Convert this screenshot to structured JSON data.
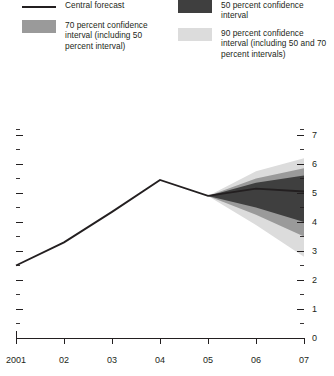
{
  "legend": {
    "entries": [
      {
        "name": "central-forecast",
        "type": "line",
        "color": "#231f20",
        "label": "Central forecast"
      },
      {
        "name": "ci-50",
        "type": "swatch",
        "color": "#3f3f3f",
        "label": "50 percent confidence interval"
      },
      {
        "name": "ci-70",
        "type": "swatch",
        "color": "#9a9a9a",
        "label": "70 percent confidence interval (including 50 percent interval)"
      },
      {
        "name": "ci-90",
        "type": "swatch",
        "color": "#dcdcdc",
        "label": "90 percent confidence interval (including 50 and 70 percent intervals)"
      }
    ]
  },
  "chart_data": {
    "type": "area",
    "title": "",
    "xlabel": "",
    "ylabel": "",
    "xlim": [
      2001,
      2007
    ],
    "ylim": [
      0,
      7.3
    ],
    "grid": false,
    "legend_position": "top",
    "x_tick_labels": [
      "2001",
      "02",
      "03",
      "04",
      "05",
      "06",
      "07"
    ],
    "x_ticks": [
      2001,
      2002,
      2003,
      2004,
      2005,
      2006,
      2007
    ],
    "y_tick_labels": [
      "0",
      "1",
      "2",
      "3",
      "4",
      "5",
      "6",
      "7"
    ],
    "y_ticks": [
      0,
      1,
      2,
      3,
      4,
      5,
      6,
      7
    ],
    "y_minor_ticks": [
      0.5,
      1.5,
      2.5,
      3.5,
      4.5,
      5.5,
      6.5,
      7.2
    ],
    "y_axis_side": "right",
    "series": [
      {
        "name": "Central forecast",
        "color": "#231f20",
        "x": [
          2001,
          2002,
          2003,
          2004,
          2005,
          2006,
          2007
        ],
        "values": [
          2.5,
          3.3,
          4.35,
          5.45,
          4.9,
          5.15,
          5.05
        ]
      },
      {
        "name": "90 percent confidence interval (including 50 and 70 percent intervals)",
        "color": "#dcdcdc",
        "x": [
          2005,
          2006,
          2007
        ],
        "upper": [
          4.9,
          5.75,
          6.2
        ],
        "lower": [
          4.9,
          3.9,
          2.8
        ]
      },
      {
        "name": "70 percent confidence interval (including 50 percent interval)",
        "color": "#9a9a9a",
        "x": [
          2005,
          2006,
          2007
        ],
        "upper": [
          4.9,
          5.5,
          5.85
        ],
        "lower": [
          4.9,
          4.25,
          3.5
        ]
      },
      {
        "name": "50 percent confidence interval",
        "color": "#3f3f3f",
        "x": [
          2005,
          2006,
          2007
        ],
        "upper": [
          4.9,
          5.35,
          5.6
        ],
        "lower": [
          4.9,
          4.5,
          4.0
        ]
      }
    ]
  }
}
